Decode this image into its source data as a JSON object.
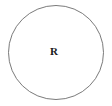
{
  "figure": {
    "kind": "geometry-diagram",
    "background_color": "#ffffff",
    "width": 112,
    "height": 106
  },
  "circle": {
    "name": "circle-outline",
    "center_x": 56,
    "center_y": 52.5,
    "radius_x": 47.5,
    "radius_y": 47,
    "stroke_color": "#6b6b6b",
    "stroke_width": 0.9,
    "fill_color": "none"
  },
  "labels": {
    "region_label": "R",
    "region_label_color": "#1b1b1b"
  }
}
